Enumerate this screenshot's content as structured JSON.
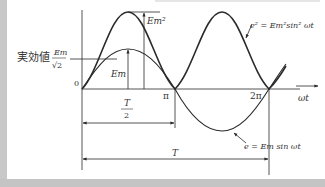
{
  "diagram": {
    "title": "",
    "labels": {
      "rms_label_jp": "実効値",
      "rms_num": "Em",
      "rms_den": "√2",
      "origin": "0",
      "em_squared": "Em²",
      "em": "Em",
      "pi": "π",
      "two_pi": "2π",
      "omega_t": "ωt",
      "half_period_num": "T",
      "half_period_den": "2",
      "period": "T",
      "e_squared_eq": "e² = Em²sin² ωt",
      "e_eq": "e = Em sin ωt"
    },
    "colors": {
      "line": "#2a2a2a",
      "text": "#333333",
      "frame_gray": "#c6c6c6"
    }
  }
}
